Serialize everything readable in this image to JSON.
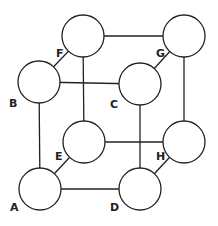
{
  "diagram": {
    "type": "cube-graph",
    "nodes": [
      {
        "id": "A",
        "label": "A",
        "cx": 40,
        "cy": 189,
        "lx": 10,
        "ly": 211
      },
      {
        "id": "B",
        "label": "B",
        "cx": 39,
        "cy": 82,
        "lx": 9,
        "ly": 107
      },
      {
        "id": "C",
        "label": "C",
        "cx": 140,
        "cy": 84,
        "lx": 110,
        "ly": 108
      },
      {
        "id": "D",
        "label": "D",
        "cx": 140,
        "cy": 189,
        "lx": 110,
        "ly": 211
      },
      {
        "id": "E",
        "label": "E",
        "cx": 84,
        "cy": 142,
        "lx": 55,
        "ly": 160
      },
      {
        "id": "F",
        "label": "F",
        "cx": 83,
        "cy": 36,
        "lx": 56,
        "ly": 57
      },
      {
        "id": "G",
        "label": "G",
        "cx": 184,
        "cy": 36,
        "lx": 156,
        "ly": 57
      },
      {
        "id": "H",
        "label": "H",
        "cx": 184,
        "cy": 142,
        "lx": 156,
        "ly": 160
      }
    ],
    "edges": [
      [
        "A",
        "B"
      ],
      [
        "A",
        "D"
      ],
      [
        "A",
        "E"
      ],
      [
        "B",
        "C"
      ],
      [
        "B",
        "F"
      ],
      [
        "C",
        "D"
      ],
      [
        "C",
        "G"
      ],
      [
        "D",
        "H"
      ],
      [
        "E",
        "F"
      ],
      [
        "E",
        "H"
      ],
      [
        "F",
        "G"
      ],
      [
        "G",
        "H"
      ]
    ],
    "radius": 21
  }
}
